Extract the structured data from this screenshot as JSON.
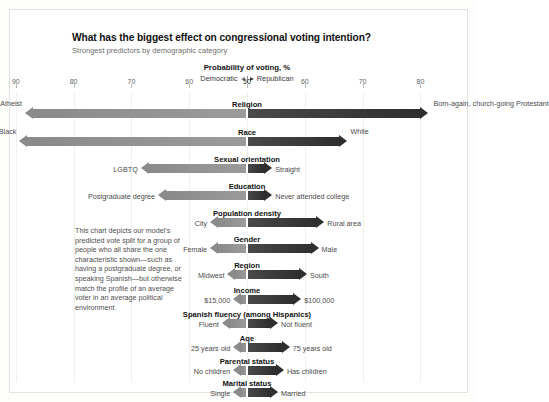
{
  "header": {
    "title": "What has the biggest effect on congressional voting intention?",
    "subtitle": "Strongest predictors by demographic category"
  },
  "axis": {
    "title": "Probability of voting, %",
    "legend_left": "Democratic",
    "legend_right": "Republican",
    "center_value": 50,
    "ticks": [
      {
        "label": "90",
        "value": 90,
        "side": "left"
      },
      {
        "label": "80",
        "value": 80,
        "side": "left"
      },
      {
        "label": "70",
        "value": 70,
        "side": "left"
      },
      {
        "label": "60",
        "value": 60,
        "side": "left"
      },
      {
        "label": "50",
        "value": 50,
        "side": "center"
      },
      {
        "label": "60",
        "value": 60,
        "side": "right"
      },
      {
        "label": "70",
        "value": 70,
        "side": "right"
      },
      {
        "label": "80",
        "value": 80,
        "side": "right"
      }
    ]
  },
  "note": "This chart depicts our model's predicted vote split for a group of people who all share the one characteristic shown—such as having a postgraduate degree, or speaking Spanish—but otherwise match the profile of an average voter in an average political environment.",
  "chart_data": {
    "type": "bar",
    "orientation": "diverging-horizontal",
    "title": "What has the biggest effect on congressional voting intention?",
    "subtitle": "Strongest predictors by demographic category",
    "xlabel": "Probability of voting, %",
    "ylabel": "",
    "grid": true,
    "legend_position": "top-center",
    "legend": [
      "Democratic",
      "Republican"
    ],
    "axis_center": 50,
    "axis_left_max": 90,
    "axis_right_max": 80,
    "categories": [
      {
        "name": "Religion",
        "left_label": "Atheist",
        "right_label": "Born-again, church-going Protestant",
        "left_value": 87,
        "right_value": 80,
        "colors": {
          "left": "#8a8a8a",
          "right": "#2e2e2e"
        }
      },
      {
        "name": "Race",
        "left_label": "Black",
        "right_label": "White",
        "left_value": 88,
        "right_value": 66,
        "colors": {
          "left": "#8a8a8a",
          "right": "#2e2e2e"
        }
      },
      {
        "name": "Sexual orientation",
        "left_label": "LGBTQ",
        "right_label": "Straight",
        "left_value": 67,
        "right_value": 53,
        "colors": {
          "left": "#8a8a8a",
          "right": "#2e2e2e"
        }
      },
      {
        "name": "Education",
        "left_label": "Postgraduate degree",
        "right_label": "Never attended college",
        "left_value": 64,
        "right_value": 53,
        "colors": {
          "left": "#8a8a8a",
          "right": "#2e2e2e"
        }
      },
      {
        "name": "Population density",
        "left_label": "City",
        "right_label": "Rural area",
        "left_value": 55,
        "right_value": 62,
        "colors": {
          "left": "#8a8a8a",
          "right": "#2e2e2e"
        }
      },
      {
        "name": "Gender",
        "left_label": "Female",
        "right_label": "Male",
        "left_value": 55,
        "right_value": 61,
        "colors": {
          "left": "#8a8a8a",
          "right": "#2e2e2e"
        }
      },
      {
        "name": "Region",
        "left_label": "Midwest",
        "right_label": "South",
        "left_value": 52,
        "right_value": 59,
        "colors": {
          "left": "#8a8a8a",
          "right": "#2e2e2e"
        }
      },
      {
        "name": "Income",
        "left_label": "$15,000",
        "right_label": "$100,000",
        "left_value": 51,
        "right_value": 58,
        "colors": {
          "left": "#8a8a8a",
          "right": "#2e2e2e"
        }
      },
      {
        "name": "Spanish fluency (among Hispanics)",
        "left_label": "Fluent",
        "right_label": "Not fluent",
        "left_value": 53,
        "right_value": 54,
        "colors": {
          "left": "#8a8a8a",
          "right": "#2e2e2e"
        }
      },
      {
        "name": "Age",
        "left_label": "25 years old",
        "right_label": "75 years old",
        "left_value": 51,
        "right_value": 56,
        "colors": {
          "left": "#8a8a8a",
          "right": "#2e2e2e"
        }
      },
      {
        "name": "Parental status",
        "left_label": "No children",
        "right_label": "Has children",
        "left_value": 51,
        "right_value": 55,
        "colors": {
          "left": "#8a8a8a",
          "right": "#2e2e2e"
        }
      },
      {
        "name": "Marital status",
        "left_label": "Single",
        "right_label": "Married",
        "left_value": 51,
        "right_value": 54,
        "colors": {
          "left": "#8a8a8a",
          "right": "#2e2e2e"
        }
      }
    ],
    "annotation": "This chart depicts our model's predicted vote split for a group of people who all share the one characteristic shown—such as having a postgraduate degree, or speaking Spanish—but otherwise match the profile of an average voter in an average political environment."
  }
}
